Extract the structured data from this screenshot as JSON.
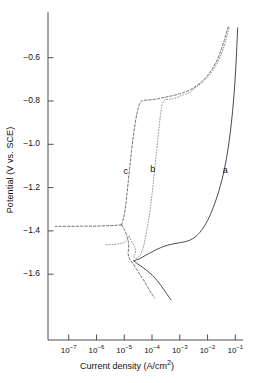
{
  "chart_data": {
    "type": "line",
    "title": "",
    "xlabel": "Current density (A/cm2)",
    "xlabel_display": "Current density (A/cm",
    "xlabel_sup": "2",
    "xlabel_tail": ")",
    "ylabel": "Potential (V vs. SCE)",
    "x_scale": "log",
    "xlim": [
      3.16e-08,
      0.32
    ],
    "ylim": [
      -1.72,
      -0.39
    ],
    "grid": false,
    "legend": "inline-curve-labels",
    "xticks": [
      {
        "value": 1e-07,
        "mantissa": "10",
        "exponent": "-7"
      },
      {
        "value": 1e-06,
        "mantissa": "10",
        "exponent": "-6"
      },
      {
        "value": 1e-05,
        "mantissa": "10",
        "exponent": "-5"
      },
      {
        "value": 0.0001,
        "mantissa": "10",
        "exponent": "-4"
      },
      {
        "value": 0.001,
        "mantissa": "10",
        "exponent": "-3"
      },
      {
        "value": 0.01,
        "mantissa": "10",
        "exponent": "-2"
      },
      {
        "value": 0.1,
        "mantissa": "10",
        "exponent": "-1"
      }
    ],
    "yticks": [
      {
        "value": -0.6,
        "label": "-0.6"
      },
      {
        "value": -0.8,
        "label": "-0.8"
      },
      {
        "value": -1.0,
        "label": "-1.0"
      },
      {
        "value": -1.2,
        "label": "-1.2"
      },
      {
        "value": -1.4,
        "label": "-1.4"
      },
      {
        "value": -1.6,
        "label": "-1.6"
      }
    ],
    "annotations": [
      {
        "text": "a",
        "x": 0.045,
        "y": -1.125,
        "curve": "a"
      },
      {
        "text": "b",
        "x": 0.00011,
        "y": -1.118,
        "curve": "b"
      },
      {
        "text": "c",
        "x": 1.2e-05,
        "y": -1.128,
        "curve": "c"
      }
    ],
    "series": [
      {
        "name": "a",
        "style": "solid",
        "color": "#404040",
        "ecorr": -1.538,
        "icorr": 2.2e-05,
        "anodic": [
          [
            2.2e-05,
            -1.538
          ],
          [
            3.6e-05,
            -1.528
          ],
          [
            6e-05,
            -1.512
          ],
          [
            0.00011,
            -1.494
          ],
          [
            0.0002,
            -1.478
          ],
          [
            0.00036,
            -1.466
          ],
          [
            0.0007,
            -1.458
          ],
          [
            0.0013,
            -1.452
          ],
          [
            0.0022,
            -1.444
          ],
          [
            0.0036,
            -1.428
          ],
          [
            0.006,
            -1.398
          ],
          [
            0.01,
            -1.352
          ],
          [
            0.016,
            -1.292
          ],
          [
            0.026,
            -1.212
          ],
          [
            0.04,
            -1.118
          ],
          [
            0.056,
            -1.012
          ],
          [
            0.072,
            -0.902
          ],
          [
            0.086,
            -0.8
          ],
          [
            0.098,
            -0.7
          ],
          [
            0.108,
            -0.606
          ],
          [
            0.116,
            -0.52
          ],
          [
            0.122,
            -0.462
          ]
        ],
        "cathodic": [
          [
            2.2e-05,
            -1.538
          ],
          [
            3e-05,
            -1.552
          ],
          [
            4.6e-05,
            -1.568
          ],
          [
            7e-05,
            -1.586
          ],
          [
            0.000105,
            -1.606
          ],
          [
            0.00015,
            -1.628
          ],
          [
            0.00021,
            -1.652
          ],
          [
            0.00029,
            -1.678
          ],
          [
            0.00039,
            -1.702
          ],
          [
            0.00048,
            -1.718
          ]
        ]
      },
      {
        "name": "b",
        "style": "dotted",
        "color": "#7a7a7a",
        "ecorr": -1.425,
        "icorr": 1.5e-05,
        "anodic": [
          [
            1.5e-05,
            -1.425
          ],
          [
            1.9e-05,
            -1.452
          ],
          [
            2.4e-05,
            -1.474
          ],
          [
            2.6e-05,
            -1.492
          ],
          [
            2.4e-05,
            -1.508
          ],
          [
            2.2e-05,
            -1.52
          ],
          [
            2.6e-05,
            -1.526
          ],
          [
            3.4e-05,
            -1.52
          ],
          [
            4.2e-05,
            -1.5
          ],
          [
            5e-05,
            -1.47
          ],
          [
            5.6e-05,
            -1.44
          ],
          [
            6.2e-05,
            -1.41
          ],
          [
            7e-05,
            -1.372
          ],
          [
            8e-05,
            -1.33
          ],
          [
            9e-05,
            -1.28
          ],
          [
            0.000102,
            -1.222
          ],
          [
            0.000115,
            -1.16
          ],
          [
            0.00013,
            -1.095
          ],
          [
            0.000148,
            -1.025
          ],
          [
            0.00017,
            -0.952
          ],
          [
            0.000195,
            -0.88
          ],
          [
            0.00023,
            -0.818
          ],
          [
            0.00029,
            -0.796
          ],
          [
            0.00042,
            -0.792
          ],
          [
            0.0007,
            -0.786
          ],
          [
            0.0013,
            -0.772
          ],
          [
            0.0022,
            -0.762
          ],
          [
            0.0034,
            -0.742
          ],
          [
            0.005,
            -0.726
          ],
          [
            0.0075,
            -0.706
          ],
          [
            0.011,
            -0.684
          ],
          [
            0.016,
            -0.656
          ],
          [
            0.023,
            -0.622
          ],
          [
            0.032,
            -0.58
          ],
          [
            0.042,
            -0.536
          ],
          [
            0.052,
            -0.492
          ],
          [
            0.06,
            -0.462
          ]
        ],
        "cathodic": [
          [
            1.5e-05,
            -1.425
          ],
          [
            1.3e-05,
            -1.44
          ],
          [
            1.05e-05,
            -1.452
          ],
          [
            7.5e-06,
            -1.458
          ],
          [
            4.5e-06,
            -1.462
          ],
          [
            2.2e-06,
            -1.464
          ]
        ]
      },
      {
        "name": "c",
        "style": "dashed",
        "color": "#555555",
        "ecorr": -1.372,
        "icorr": 8e-06,
        "anodic": [
          [
            8e-06,
            -1.372
          ],
          [
            1.05e-05,
            -1.398
          ],
          [
            1.25e-05,
            -1.424
          ],
          [
            1.4e-05,
            -1.45
          ],
          [
            1.45e-05,
            -1.478
          ],
          [
            1.38e-05,
            -1.505
          ],
          [
            1.55e-05,
            -1.528
          ],
          [
            2e-05,
            -1.548
          ],
          [
            2.8e-05,
            -1.578
          ],
          [
            4e-05,
            -1.608
          ],
          [
            5.6e-05,
            -1.638
          ],
          [
            7.6e-05,
            -1.668
          ],
          [
            0.0001,
            -1.692
          ],
          [
            0.000125,
            -1.71
          ]
        ],
        "anodic2": [
          [
            8e-06,
            -1.372
          ],
          [
            9.5e-06,
            -1.34
          ],
          [
            1.08e-05,
            -1.3
          ],
          [
            1.2e-05,
            -1.252
          ],
          [
            1.33e-05,
            -1.198
          ],
          [
            1.48e-05,
            -1.14
          ],
          [
            1.66e-05,
            -1.08
          ],
          [
            1.88e-05,
            -1.018
          ],
          [
            2.15e-05,
            -0.958
          ],
          [
            2.5e-05,
            -0.9
          ],
          [
            2.95e-05,
            -0.85
          ],
          [
            3.6e-05,
            -0.812
          ],
          [
            4.6e-05,
            -0.798
          ],
          [
            6.5e-05,
            -0.796
          ],
          [
            0.0001,
            -0.794
          ],
          [
            0.00016,
            -0.79
          ],
          [
            0.00026,
            -0.784
          ],
          [
            0.00045,
            -0.778
          ],
          [
            0.0008,
            -0.77
          ],
          [
            0.0014,
            -0.76
          ],
          [
            0.0024,
            -0.748
          ],
          [
            0.004,
            -0.73
          ],
          [
            0.0065,
            -0.708
          ],
          [
            0.01,
            -0.682
          ],
          [
            0.015,
            -0.65
          ],
          [
            0.022,
            -0.612
          ],
          [
            0.03,
            -0.568
          ],
          [
            0.04,
            -0.52
          ],
          [
            0.05,
            -0.476
          ],
          [
            0.058,
            -0.452
          ]
        ],
        "cathodic": [
          [
            8e-06,
            -1.372
          ],
          [
            5.5e-06,
            -1.374
          ],
          [
            3e-06,
            -1.376
          ],
          [
            1.5e-06,
            -1.377
          ],
          [
            7e-07,
            -1.378
          ],
          [
            3e-07,
            -1.378
          ],
          [
            1.2e-07,
            -1.379
          ],
          [
            5e-08,
            -1.379
          ],
          [
            3.3e-08,
            -1.379
          ]
        ]
      }
    ]
  },
  "axes": {
    "y_title": "Potential (V vs. SCE)",
    "x_title_main": "Current density (A/cm",
    "x_title_sup": "2",
    "x_title_end": ")"
  }
}
